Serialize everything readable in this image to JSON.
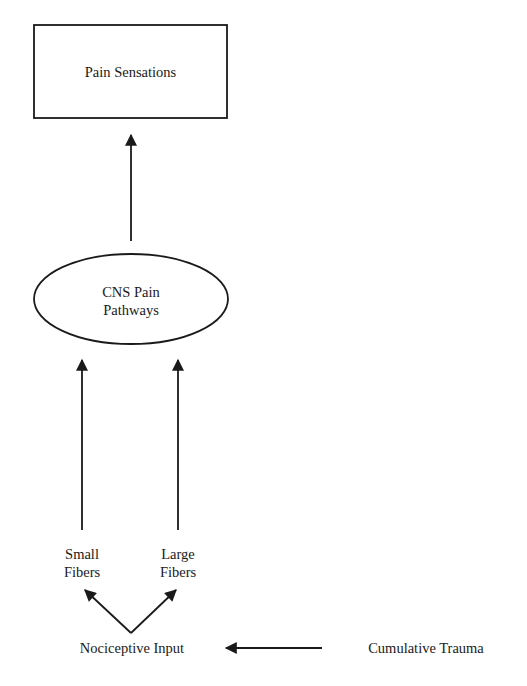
{
  "diagram": {
    "nodes": {
      "pain_sensations": {
        "label": "Pain Sensations",
        "shape": "rectangle"
      },
      "cns_pain_pathways": {
        "line1": "CNS Pain",
        "line2": "Pathways",
        "shape": "ellipse"
      },
      "small_fibers": {
        "line1": "Small",
        "line2": "Fibers"
      },
      "large_fibers": {
        "line1": "Large",
        "line2": "Fibers"
      },
      "nociceptive_input": {
        "label": "Nociceptive Input"
      },
      "cumulative_trauma": {
        "label": "Cumulative Trauma"
      }
    },
    "edges": [
      {
        "from": "cumulative_trauma",
        "to": "nociceptive_input"
      },
      {
        "from": "nociceptive_input",
        "to": "small_fibers"
      },
      {
        "from": "nociceptive_input",
        "to": "large_fibers"
      },
      {
        "from": "small_fibers",
        "to": "cns_pain_pathways"
      },
      {
        "from": "large_fibers",
        "to": "cns_pain_pathways"
      },
      {
        "from": "cns_pain_pathways",
        "to": "pain_sensations"
      }
    ],
    "colors": {
      "stroke": "#1a1a1a",
      "background": "#ffffff"
    }
  }
}
